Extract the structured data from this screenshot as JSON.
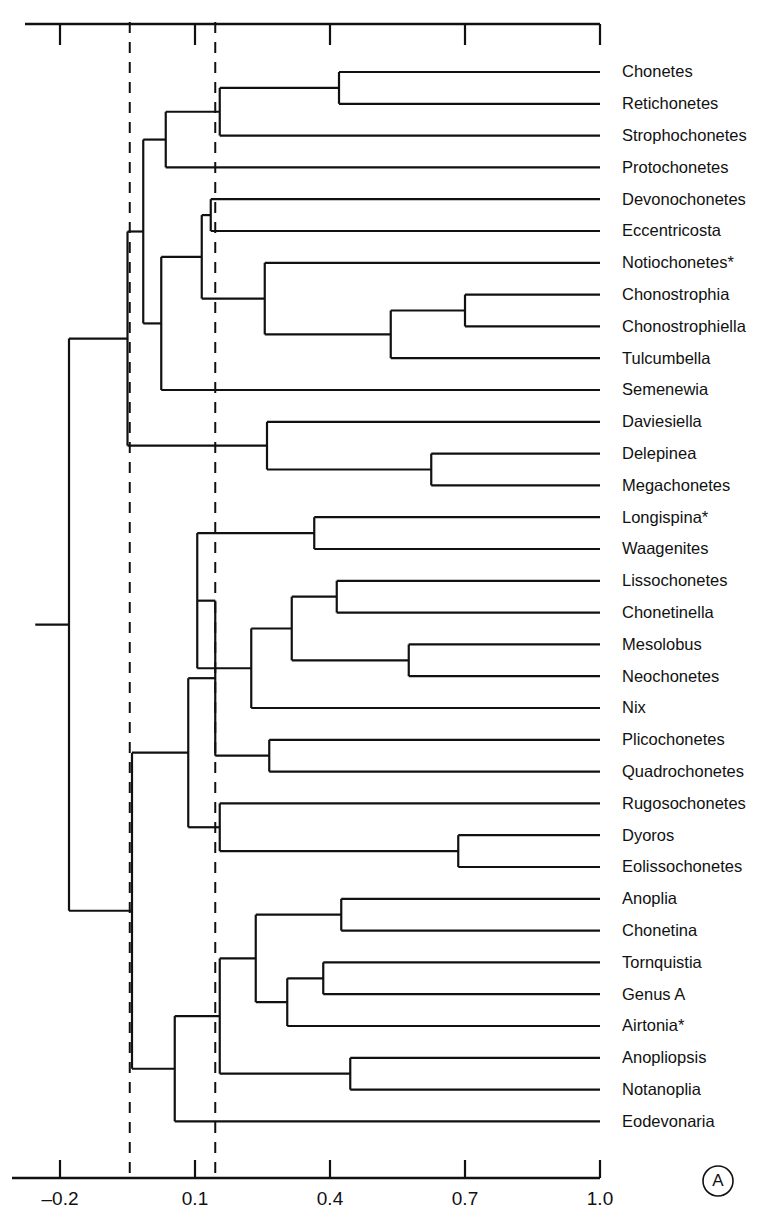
{
  "figure": {
    "panel_letter": "A",
    "width": 784,
    "height": 1223,
    "line_color": "#111111",
    "background_color": "#ffffff"
  },
  "chart_data": {
    "type": "dendrogram",
    "title": "",
    "xlabel": "",
    "ylabel": "",
    "xlim": [
      -0.2,
      1.0
    ],
    "grid": false,
    "legend": null,
    "axis": {
      "position": "bottom-and-top",
      "tick_values": [
        -0.2,
        0.1,
        0.4,
        0.7,
        1.0
      ],
      "tick_labels": [
        "–0.2",
        "0.1",
        "0.4",
        "0.7",
        "1.0"
      ],
      "top_axis_ticks": [
        -0.2,
        0.1,
        0.4,
        0.7,
        1.0
      ],
      "direction": "decreasing-similarity-to-the-left"
    },
    "reference_lines": [
      {
        "name": "phenon-line-1",
        "value": -0.045,
        "style": "dashed"
      },
      {
        "name": "phenon-line-2",
        "value": 0.145,
        "style": "dashed"
      }
    ],
    "leaves": [
      {
        "index": 0,
        "label": "Chonetes",
        "asterisk": false
      },
      {
        "index": 1,
        "label": "Retichonetes",
        "asterisk": false
      },
      {
        "index": 2,
        "label": "Strophochonetes",
        "asterisk": false
      },
      {
        "index": 3,
        "label": "Protochonetes",
        "asterisk": false
      },
      {
        "index": 4,
        "label": "Devonochonetes",
        "asterisk": false
      },
      {
        "index": 5,
        "label": "Eccentricosta",
        "asterisk": false
      },
      {
        "index": 6,
        "label": "Notiochonetes*",
        "asterisk": true
      },
      {
        "index": 7,
        "label": "Chonostrophia",
        "asterisk": false
      },
      {
        "index": 8,
        "label": "Chonostrophiella",
        "asterisk": false
      },
      {
        "index": 9,
        "label": "Tulcumbella",
        "asterisk": false
      },
      {
        "index": 10,
        "label": "Semenewia",
        "asterisk": false
      },
      {
        "index": 11,
        "label": "Daviesiella",
        "asterisk": false
      },
      {
        "index": 12,
        "label": "Delepinea",
        "asterisk": false
      },
      {
        "index": 13,
        "label": "Megachonetes",
        "asterisk": false
      },
      {
        "index": 14,
        "label": "Longispina*",
        "asterisk": true
      },
      {
        "index": 15,
        "label": "Waagenites",
        "asterisk": false
      },
      {
        "index": 16,
        "label": "Lissochonetes",
        "asterisk": false
      },
      {
        "index": 17,
        "label": "Chonetinella",
        "asterisk": false
      },
      {
        "index": 18,
        "label": "Mesolobus",
        "asterisk": false
      },
      {
        "index": 19,
        "label": "Neochonetes",
        "asterisk": false
      },
      {
        "index": 20,
        "label": "Nix",
        "asterisk": false
      },
      {
        "index": 21,
        "label": "Plicochonetes",
        "asterisk": false
      },
      {
        "index": 22,
        "label": "Quadrochonetes",
        "asterisk": false
      },
      {
        "index": 23,
        "label": "Rugosochonetes",
        "asterisk": false
      },
      {
        "index": 24,
        "label": "Dyoros",
        "asterisk": false
      },
      {
        "index": 25,
        "label": "Eolissochonetes",
        "asterisk": false
      },
      {
        "index": 26,
        "label": "Anoplia",
        "asterisk": false
      },
      {
        "index": 27,
        "label": "Chonetina",
        "asterisk": false
      },
      {
        "index": 28,
        "label": "Tornquistia",
        "asterisk": false
      },
      {
        "index": 29,
        "label": "Genus A",
        "asterisk": false
      },
      {
        "index": 30,
        "label": "Airtonia*",
        "asterisk": true
      },
      {
        "index": 31,
        "label": "Anopliopsis",
        "asterisk": false
      },
      {
        "index": 32,
        "label": "Notanoplia",
        "asterisk": false
      },
      {
        "index": 33,
        "label": "Eodevonaria",
        "asterisk": false
      }
    ],
    "nodes": [
      {
        "name": "n-chonetes-retichonetes",
        "value": 0.42,
        "children": [
          "Chonetes",
          "Retichonetes"
        ]
      },
      {
        "name": "n-strophochonetes",
        "value": 0.15,
        "children": [
          "n-chonetes-retichonetes",
          "Strophochonetes"
        ]
      },
      {
        "name": "n-protochonetes",
        "value": 0.03,
        "children": [
          "n-strophochonetes",
          "Protochonetes"
        ]
      },
      {
        "name": "n-devonochonetes-eccentricosta",
        "value": 0.13,
        "children": [
          "Devonochonetes",
          "Eccentricosta"
        ]
      },
      {
        "name": "n-chonostrophia-chonostrophiella",
        "value": 0.7,
        "children": [
          "Chonostrophia",
          "Chonostrophiella"
        ]
      },
      {
        "name": "n-chonostrophiid-tulcumbella",
        "value": 0.53,
        "children": [
          "n-chonostrophia-chonostrophiella",
          "Tulcumbella"
        ]
      },
      {
        "name": "n-notiochonetes-clade",
        "value": 0.25,
        "children": [
          "Notiochonetes*",
          "n-chonostrophiid-tulcumbella"
        ]
      },
      {
        "name": "n-devonochonetes-group",
        "value": 0.11,
        "children": [
          "n-devonochonetes-eccentricosta",
          "n-notiochonetes-clade"
        ]
      },
      {
        "name": "n-semenewia",
        "value": 0.02,
        "children": [
          "n-devonochonetes-group",
          "Semenewia"
        ]
      },
      {
        "name": "n-upper-chonetid",
        "value": -0.02,
        "children": [
          "n-protochonetes",
          "n-semenewia"
        ]
      },
      {
        "name": "n-delepinea-megachonetes",
        "value": 0.62,
        "children": [
          "Delepinea",
          "Megachonetes"
        ]
      },
      {
        "name": "n-daviesiella-clade",
        "value": 0.26,
        "children": [
          "Daviesiella",
          "n-delepinea-megachonetes"
        ]
      },
      {
        "name": "n-chonetoidea-upper",
        "value": -0.05,
        "children": [
          "n-upper-chonetid",
          "n-daviesiella-clade"
        ]
      },
      {
        "name": "n-longispina-waagenites",
        "value": 0.36,
        "children": [
          "Longispina*",
          "Waagenites"
        ]
      },
      {
        "name": "n-lissochonetes-chonetinella",
        "value": 0.41,
        "children": [
          "Lissochonetes",
          "Chonetinella"
        ]
      },
      {
        "name": "n-mesolobus-neochonetes",
        "value": 0.57,
        "children": [
          "Mesolobus",
          "Neochonetes"
        ]
      },
      {
        "name": "n-lissochonetes-group",
        "value": 0.31,
        "children": [
          "n-lissochonetes-chonetinella",
          "n-mesolobus-neochonetes"
        ]
      },
      {
        "name": "n-nix-clade",
        "value": 0.22,
        "children": [
          "n-lissochonetes-group",
          "Nix"
        ]
      },
      {
        "name": "n-longispina-branch",
        "value": 0.1,
        "children": [
          "n-longispina-waagenites",
          "n-nix-clade"
        ]
      },
      {
        "name": "n-plicochonetes-quadrochonetes",
        "value": 0.26,
        "children": [
          "Plicochonetes",
          "Quadrochonetes"
        ]
      },
      {
        "name": "n-plicochonetes-clade",
        "value": 0.14,
        "children": [
          "n-nix-clade-parent",
          "n-plicochonetes-quadrochonetes"
        ]
      },
      {
        "name": "n-dyoros-eolissochonetes",
        "value": 0.68,
        "children": [
          "Dyoros",
          "Eolissochonetes"
        ]
      },
      {
        "name": "n-rugosochonetes-clade",
        "value": 0.15,
        "children": [
          "Rugosochonetes",
          "n-dyoros-eolissochonetes"
        ]
      },
      {
        "name": "n-rugosochonetid-group",
        "value": 0.08,
        "children": [
          "n-plicochonetes-clade",
          "n-rugosochonetes-clade"
        ]
      },
      {
        "name": "n-anoplia-chonetina",
        "value": 0.42,
        "children": [
          "Anoplia",
          "Chonetina"
        ]
      },
      {
        "name": "n-tornquistia-genusa",
        "value": 0.38,
        "children": [
          "Tornquistia",
          "Genus A"
        ]
      },
      {
        "name": "n-airtonia-clade",
        "value": 0.3,
        "children": [
          "n-tornquistia-genusa",
          "Airtonia*"
        ]
      },
      {
        "name": "n-anoplia-group",
        "value": 0.23,
        "children": [
          "n-anoplia-chonetina",
          "n-airtonia-clade"
        ]
      },
      {
        "name": "n-anopliopsis-notanoplia",
        "value": 0.44,
        "children": [
          "Anopliopsis",
          "Notanoplia"
        ]
      },
      {
        "name": "n-anopliid-clade",
        "value": 0.15,
        "children": [
          "n-anoplia-group",
          "n-anopliopsis-notanoplia"
        ]
      },
      {
        "name": "n-eodevonaria-clade",
        "value": 0.05,
        "children": [
          "n-anopliid-clade",
          "Eodevonaria"
        ]
      },
      {
        "name": "n-lower-chonetid",
        "value": -0.04,
        "children": [
          "n-rugosochonetid-group",
          "n-eodevonaria-clade"
        ]
      },
      {
        "name": "n-root",
        "value": -0.18,
        "children": [
          "n-chonetoidea-upper",
          "n-lower-chonetid"
        ]
      }
    ]
  }
}
